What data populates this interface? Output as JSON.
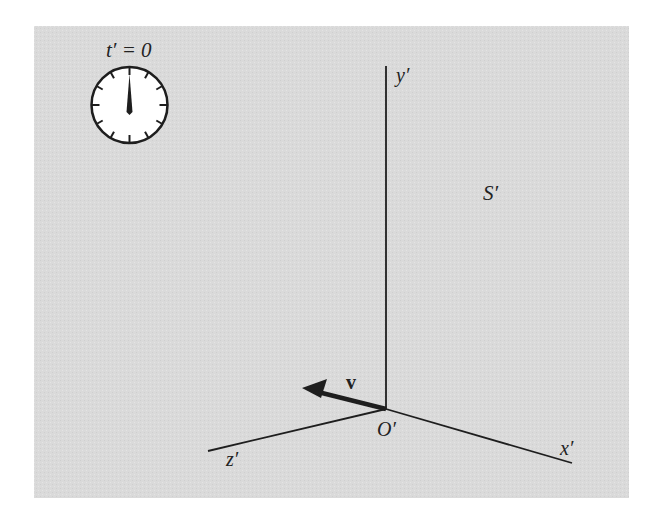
{
  "figure": {
    "background_color": "#ffffff",
    "panel_color": "#dcdcdc",
    "ink_color": "#1e1e1e",
    "panel": {
      "x": 34,
      "y": 26,
      "width": 595,
      "height": 472
    }
  },
  "clock": {
    "label": "t′ = 0",
    "center": [
      129.5,
      105
    ],
    "radius": 39,
    "hand_angle_deg": 0
  },
  "axes": {
    "origin_label": "O′",
    "origin": [
      386,
      409
    ],
    "x": {
      "label": "x′",
      "end": [
        572,
        463
      ]
    },
    "y": {
      "label": "y′",
      "end": [
        386,
        66
      ]
    },
    "z": {
      "label": "z′",
      "end": [
        208,
        451
      ]
    }
  },
  "frame_label": "S′",
  "velocity": {
    "label": "v",
    "tail": [
      386,
      409
    ],
    "tip": [
      302,
      388
    ]
  }
}
